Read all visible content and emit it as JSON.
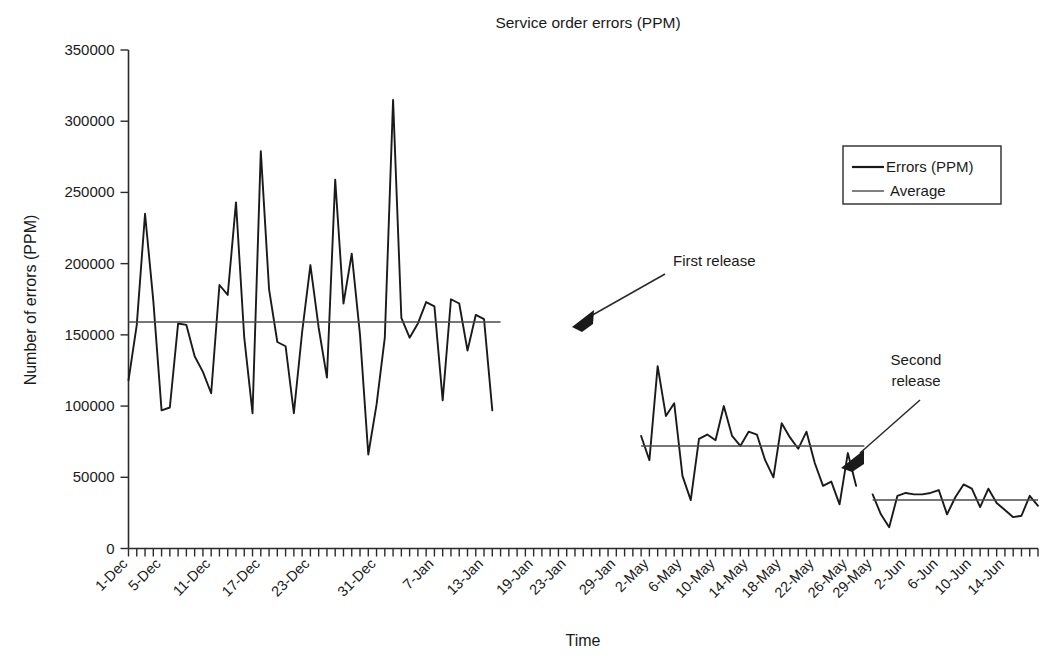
{
  "chart_data": {
    "type": "line",
    "title": "Service order errors (PPM)",
    "xlabel": "Time",
    "ylabel": "Number of errors (PPM)",
    "ylim": [
      0,
      350000
    ],
    "ytick_values": [
      0,
      50000,
      100000,
      150000,
      200000,
      250000,
      300000,
      350000
    ],
    "ytick_labels": [
      "0",
      "50000",
      "100000",
      "150000",
      "200000",
      "250000",
      "300000",
      "350000"
    ],
    "grid": false,
    "legend_position": "upper-right",
    "legend": [
      "Errors (PPM)",
      "Average"
    ],
    "x_tick_labels": [
      "1-Dec",
      "5-Dec",
      "11-Dec",
      "17-Dec",
      "23-Dec",
      "31-Dec",
      "7-Jan",
      "13-Jan",
      "19-Jan",
      "23-Jan",
      "29-Jan",
      "2-May",
      "6-May",
      "10-May",
      "14-May",
      "18-May",
      "22-May",
      "26-May",
      "29-May",
      "2-Jun",
      "6-Jun",
      "10-Jun",
      "14-Jun"
    ],
    "x_tick_positions": [
      0,
      4,
      10,
      16,
      22,
      30,
      37,
      43,
      49,
      53,
      59,
      63,
      67,
      71,
      75,
      79,
      83,
      87,
      90,
      94,
      98,
      102,
      106
    ],
    "n_minor_ticks": 110,
    "series": [
      {
        "name": "Errors (PPM)",
        "segment": "pre-release",
        "x_start": 0,
        "values": [
          118000,
          157000,
          235000,
          174000,
          97000,
          99000,
          158000,
          157000,
          135000,
          124000,
          109000,
          185000,
          178000,
          243000,
          148000,
          95000,
          279000,
          182000,
          145000,
          142000,
          95000,
          152000,
          199000,
          155000,
          120000,
          259000,
          172000,
          207000,
          150000,
          66000,
          101000,
          148000,
          315000,
          162000,
          148000,
          158000,
          173000,
          170000,
          104000,
          175000,
          172000,
          139000,
          164000,
          161000,
          97000
        ]
      },
      {
        "name": "Errors (PPM)",
        "segment": "after-first-release",
        "x_start": 62,
        "values": [
          79000,
          62000,
          128000,
          93000,
          102000,
          51000,
          34000,
          77000,
          80000,
          76000,
          100000,
          79000,
          72000,
          82000,
          80000,
          62000,
          50000,
          88000,
          78000,
          70000,
          82000,
          60000,
          44000,
          47000,
          31000,
          67000,
          44000
        ]
      },
      {
        "name": "Errors (PPM)",
        "segment": "after-second-release",
        "x_start": 90,
        "values": [
          38000,
          24000,
          15000,
          37000,
          39000,
          38000,
          38000,
          39000,
          41000,
          24000,
          36000,
          45000,
          42000,
          29000,
          42000,
          32000,
          27000,
          22000,
          23000,
          37000,
          30000
        ]
      }
    ],
    "averages": [
      {
        "name": "Average",
        "segment": "pre-release",
        "value": 159000,
        "x_start": 0,
        "x_end": 45
      },
      {
        "name": "Average",
        "segment": "after-first-release",
        "value": 72000,
        "x_start": 62,
        "x_end": 89
      },
      {
        "name": "Average",
        "segment": "after-second-release",
        "value": 34000,
        "x_start": 90,
        "x_end": 110
      }
    ],
    "annotations": [
      {
        "id": "first-release",
        "text": "First release",
        "lines": [
          "First release"
        ]
      },
      {
        "id": "second-release",
        "text": "Second release",
        "lines": [
          "Second",
          "release"
        ]
      }
    ],
    "colors": {
      "series": "#1a1a1a",
      "average": "#4a4a4a",
      "axis": "#2a2a2a",
      "background": "#ffffff"
    }
  }
}
